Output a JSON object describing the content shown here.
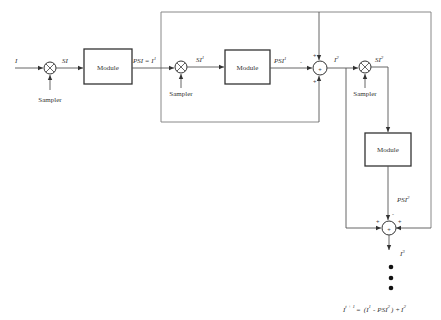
{
  "diagram": {
    "input_label": "I",
    "sampler_label": "Sampler",
    "module_label": "Module",
    "sum_symbol": "+",
    "stage1": {
      "sampled_label": "SI",
      "output_label": "PSI = I",
      "output_sup": "1"
    },
    "stage2": {
      "sampled_label": "SI",
      "sampled_sup": "1",
      "output_label": "PSI",
      "output_sup": "1",
      "minus_sign": "-",
      "plus_top": "+",
      "plus_bottom": "+",
      "sum_output_label": "I",
      "sum_output_sup": "2"
    },
    "stage3": {
      "sampled_label": "SI",
      "sampled_sup": "2",
      "output_label": "PSI",
      "output_sup": "2",
      "minus_sign": "-",
      "plus_left": "+",
      "plus_right": "+",
      "sum_output_label": "I",
      "sum_output_sup": "3"
    },
    "formula": {
      "lhs": "I",
      "lhs_sup": "t + 1",
      "eq": "=",
      "paren_open": "(I",
      "term1_sup": "1",
      "minus": "-",
      "term2": "PSI",
      "term2_sup": "2",
      "paren_close": ")",
      "plus": "+",
      "term3": "I",
      "term3_sup": "2"
    }
  }
}
